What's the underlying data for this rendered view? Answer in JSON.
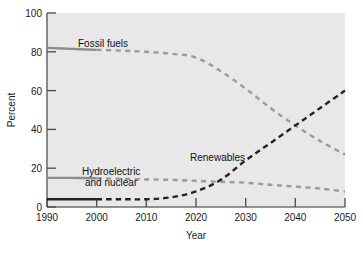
{
  "chart_data": {
    "type": "line",
    "title": "",
    "xlabel": "Year",
    "ylabel": "Percent",
    "xlim": [
      1990,
      2050
    ],
    "ylim": [
      0,
      100
    ],
    "grid": false,
    "legend_position": "inline-labels",
    "background_color": "#e8e8e8",
    "xticks": [
      "1990",
      "2000",
      "2010",
      "2020",
      "2030",
      "2040",
      "2050"
    ],
    "yticks": [
      "0",
      "20",
      "40",
      "60",
      "80",
      "100"
    ],
    "x": [
      1990,
      1995,
      2000,
      2005,
      2010,
      2015,
      2020,
      2025,
      2030,
      2035,
      2040,
      2045,
      2050
    ],
    "series": [
      {
        "name": "Fossil fuels",
        "color": "#8c8c8c",
        "style": "solid-then-dashed",
        "solid_until": 2000,
        "values": [
          82,
          81.5,
          81,
          80.6,
          80,
          79,
          77,
          70,
          61,
          51,
          42,
          34,
          27
        ],
        "label": "Fossil fuels"
      },
      {
        "name": "Hydroelectric and nuclear",
        "color": "#8c8c8c",
        "style": "solid-then-dashed",
        "solid_until": 2000,
        "values": [
          15,
          15,
          14.8,
          14.5,
          14.2,
          14,
          13.5,
          13,
          12.5,
          11.5,
          10.5,
          9.5,
          8
        ],
        "label_line1": "Hydroelectric",
        "label_line2": "and nuclear"
      },
      {
        "name": "Renewables",
        "color": "#232323",
        "style": "solid-then-dashed",
        "solid_until": 2000,
        "values": [
          4,
          4,
          4,
          4,
          4,
          5,
          8,
          14,
          24,
          33,
          42,
          51,
          60
        ],
        "label": "Renewables"
      }
    ]
  },
  "labels": {
    "y_axis_title": "Percent",
    "x_axis_title": "Year",
    "fossil_fuels": "Fossil fuels",
    "hydro_line1": "Hydroelectric",
    "hydro_line2": "and nuclear",
    "renewables": "Renewables",
    "y_0": "0",
    "y_20": "20",
    "y_40": "40",
    "y_60": "60",
    "y_80": "80",
    "y_100": "100",
    "x_1990": "1990",
    "x_2000": "2000",
    "x_2010": "2010",
    "x_2020": "2020",
    "x_2030": "2030",
    "x_2040": "2040",
    "x_2050": "2050"
  }
}
